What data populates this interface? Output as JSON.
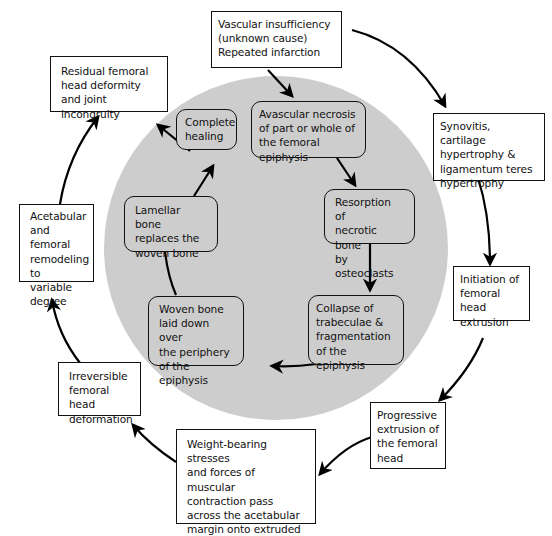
{
  "diagram": {
    "title": "",
    "background_circle_color": "#cdcdcd",
    "outer_cycle": [
      {
        "id": "vascular",
        "label": "Vascular insufficiency\n(unknown cause)\nRepeated infarction"
      },
      {
        "id": "synovitis",
        "label": "Synovitis,  cartilage\nhypertrophy &\nligamentum teres\nhypertrophy"
      },
      {
        "id": "initiation",
        "label": "Initiation of\nfemoral head\nextrusion"
      },
      {
        "id": "progressive",
        "label": "Progressive\nextrusion of\nthe femoral\nhead"
      },
      {
        "id": "weight",
        "label": "Weight-bearing stresses\nand forces of muscular\ncontraction pass\nacross the acetabular\nmargin onto extruded\nfemoral head"
      },
      {
        "id": "irreversible",
        "label": "Irreversible\nfemoral head\ndeformation"
      },
      {
        "id": "acetabular",
        "label": "Acetabular\nand femoral\nremodeling\nto variable\ndegree"
      },
      {
        "id": "residual",
        "label": "Residual femoral\nhead deformity\nand joint incongruity"
      }
    ],
    "inner_cycle": [
      {
        "id": "avascular",
        "label": "Avascular necrosis\nof part or whole of\nthe femoral epiphysis"
      },
      {
        "id": "resorption",
        "label": "Resorption of\nnecrotic bone\nby osteoclasts"
      },
      {
        "id": "collapse",
        "label": "Collapse of\ntrabeculae &\nfragmentation\nof the epiphysis"
      },
      {
        "id": "woven",
        "label": "Woven bone\nlaid down over\nthe periphery\nof the epiphysis"
      },
      {
        "id": "lamellar",
        "label": "Lamellar bone\nreplaces the\nwoven bone"
      },
      {
        "id": "healing",
        "label": "Complete\nhealing"
      }
    ],
    "edges": [
      {
        "from": "vascular",
        "to": "avascular"
      },
      {
        "from": "vascular",
        "to": "synovitis"
      },
      {
        "from": "synovitis",
        "to": "initiation"
      },
      {
        "from": "initiation",
        "to": "progressive"
      },
      {
        "from": "progressive",
        "to": "weight"
      },
      {
        "from": "weight",
        "to": "irreversible"
      },
      {
        "from": "irreversible",
        "to": "acetabular"
      },
      {
        "from": "acetabular",
        "to": "residual"
      },
      {
        "from": "avascular",
        "to": "resorption"
      },
      {
        "from": "resorption",
        "to": "collapse"
      },
      {
        "from": "collapse",
        "to": "woven"
      },
      {
        "from": "woven",
        "to": "lamellar"
      },
      {
        "from": "lamellar",
        "to": "healing"
      },
      {
        "from": "healing",
        "to": "residual"
      }
    ]
  }
}
